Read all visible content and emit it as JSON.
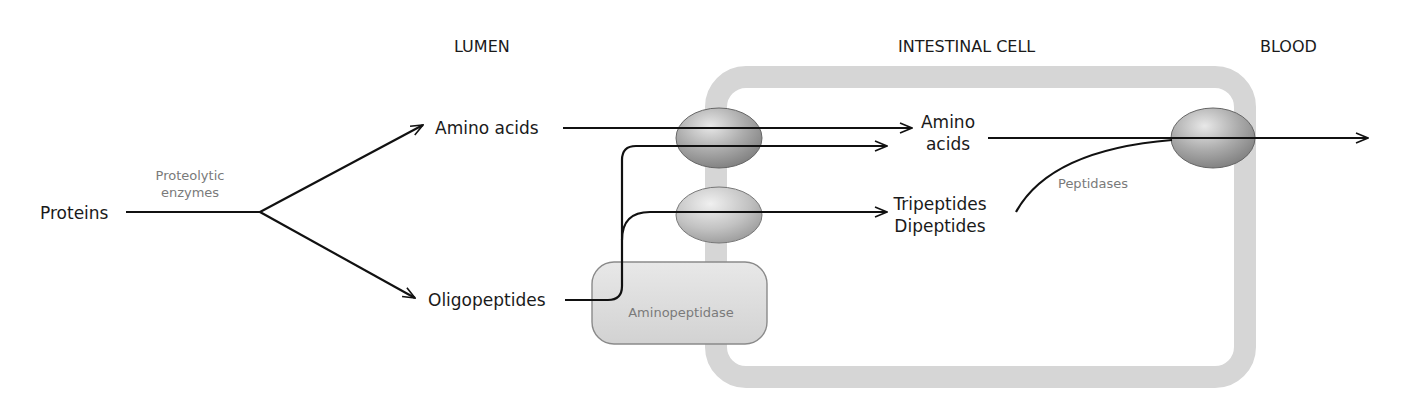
{
  "regions": {
    "lumen": "LUMEN",
    "intestinal_cell": "INTESTINAL CELL",
    "blood": "BLOOD"
  },
  "nodes": {
    "proteins": "Proteins",
    "amino_acids_lumen": "Amino acids",
    "oligopeptides": "Oligopeptides",
    "amino_acids_cell_line1": "Amino",
    "amino_acids_cell_line2": "acids",
    "tripeptides": "Tripeptides",
    "dipeptides": "Dipeptides"
  },
  "enzymes": {
    "proteolytic_line1": "Proteolytic",
    "proteolytic_line2": "enzymes",
    "aminopeptidase": "Aminopeptidase",
    "peptidases": "Peptidases"
  },
  "colors": {
    "membrane": "#d6d6d6",
    "transporter": "#a8a8a8",
    "aminopeptidase_fill": "#dcdcdc",
    "arrow": "#111111",
    "enzyme_text": "#7a7a7a"
  }
}
